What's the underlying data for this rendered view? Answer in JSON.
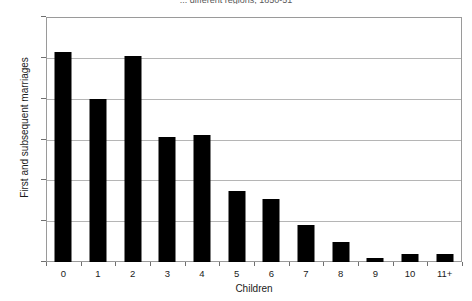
{
  "chart_data": {
    "type": "bar",
    "title": "... different regions, 1850-51",
    "xlabel": "Children",
    "ylabel": "First and subsequent marriages",
    "categories": [
      "0",
      "1",
      "2",
      "3",
      "4",
      "5",
      "6",
      "7",
      "8",
      "9",
      "10",
      "11+"
    ],
    "values": [
      103,
      80,
      101,
      61,
      62,
      35,
      31,
      18,
      10,
      2,
      4,
      4
    ],
    "ylim": [
      0,
      120
    ],
    "yticks": [
      0,
      20,
      40,
      60,
      80,
      100,
      120
    ],
    "ytick_labels": [
      "0",
      "20",
      "40",
      "60",
      "80",
      "100",
      "120"
    ],
    "grid": true,
    "grid_axis": "y",
    "legend": "none",
    "bar_color": "#000000",
    "grid_color": "#b5b5b5",
    "axis_color": "#9a9a9a",
    "text_color": "#1a1a1a",
    "background": "#ffffff"
  }
}
